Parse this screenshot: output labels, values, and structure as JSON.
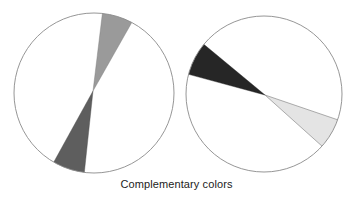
{
  "caption": "Complementary colors",
  "colors": {
    "background": "#ffffff",
    "outline": "#8a8a8a",
    "left_top_wedge": "#9a9a9a",
    "left_bottom_wedge": "#5e5e5e",
    "right_dark_wedge": "#262626",
    "right_light_wedge": "#e4e4e4"
  },
  "circles": [
    {
      "name": "left",
      "cx": 94,
      "cy": 93,
      "r": 80,
      "wedges": [
        {
          "name": "top-medium-gray-wedge",
          "fill": "#9a9a9a",
          "points": "93,91 106,14 133,24"
        },
        {
          "name": "bottom-dark-gray-wedge",
          "fill": "#5e5e5e",
          "points": "93,91 53,163 80,173"
        }
      ]
    },
    {
      "name": "right",
      "cx": 264,
      "cy": 94,
      "r": 78,
      "wedges": [
        {
          "name": "upper-left-black-wedge",
          "fill": "#262626",
          "points": "265,95 202,43 193,68"
        },
        {
          "name": "lower-right-light-gray-wedge",
          "fill": "#e4e4e4",
          "points": "265,95 337,120 325,145"
        }
      ]
    }
  ]
}
